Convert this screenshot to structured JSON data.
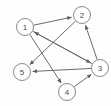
{
  "diagram": {
    "type": "directed-graph",
    "background_color": "#fefefe",
    "node_fill_color": "#ffffff",
    "node_stroke_color": "#8a8a8a",
    "edge_color": "#6b6b6b",
    "label_color": "#4a4a4a",
    "nodes": [
      {
        "id": "1",
        "label": "1",
        "x": 25,
        "y": 27,
        "r": 8.5
      },
      {
        "id": "2",
        "label": "2",
        "x": 82,
        "y": 15,
        "r": 8.5
      },
      {
        "id": "3",
        "label": "3",
        "x": 100,
        "y": 68,
        "r": 8.5
      },
      {
        "id": "4",
        "label": "4",
        "x": 67,
        "y": 92,
        "r": 8.5
      },
      {
        "id": "5",
        "label": "5",
        "x": 22,
        "y": 72,
        "r": 8.5
      }
    ],
    "edges": [
      {
        "from": "1",
        "to": "2",
        "directed": true
      },
      {
        "from": "1",
        "to": "3",
        "directed": true
      },
      {
        "from": "1",
        "to": "4",
        "directed": true
      },
      {
        "from": "2",
        "to": "5",
        "directed": true
      },
      {
        "from": "3",
        "to": "1",
        "directed": true
      },
      {
        "from": "3",
        "to": "2",
        "directed": true
      },
      {
        "from": "3",
        "to": "5",
        "directed": true
      },
      {
        "from": "4",
        "to": "3",
        "directed": true
      }
    ]
  }
}
